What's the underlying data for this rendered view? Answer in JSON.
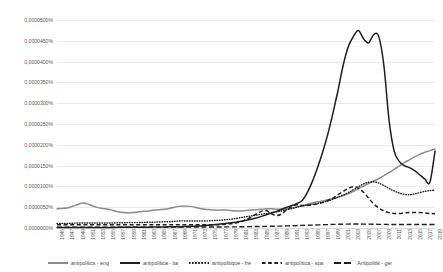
{
  "chart_data": {
    "type": "line",
    "title": "",
    "xlabel": "",
    "ylabel": "",
    "grid": true,
    "legend_position": "bottom",
    "ylim": [
      0,
      5e-05
    ],
    "y_ticks": [
      "0,0000000%",
      "0,0000050%",
      "0,0000100%",
      "0,0000150%",
      "0,0000200%",
      "0,0000250%",
      "0,0000300%",
      "0,0000350%",
      "0,0000400%",
      "0,0000450%",
      "0,0000500%"
    ],
    "y_tick_values": [
      0,
      5e-06,
      1e-05,
      1.5e-05,
      2e-05,
      2.5e-05,
      3e-05,
      3.5e-05,
      4e-05,
      4.5e-05,
      5e-05
    ],
    "x": [
      1945,
      1946,
      1947,
      1948,
      1949,
      1950,
      1951,
      1952,
      1953,
      1954,
      1955,
      1956,
      1957,
      1958,
      1959,
      1960,
      1961,
      1962,
      1963,
      1964,
      1965,
      1966,
      1967,
      1968,
      1969,
      1970,
      1971,
      1972,
      1973,
      1974,
      1975,
      1976,
      1977,
      1978,
      1979,
      1980,
      1981,
      1982,
      1983,
      1984,
      1985,
      1986,
      1987,
      1988,
      1989,
      1990,
      1991,
      1992,
      1993,
      1994,
      1995,
      1996,
      1997,
      1998,
      1999,
      2000,
      2001,
      2002,
      2003,
      2004,
      2005,
      2006,
      2007,
      2008,
      2009,
      2010,
      2011,
      2012,
      2013,
      2014,
      2015,
      2016,
      2017,
      2018,
      2019
    ],
    "x_ticks": [
      "1945",
      "1947",
      "1949",
      "1951",
      "1953",
      "1955",
      "1957",
      "1959",
      "1961",
      "1963",
      "1965",
      "1967",
      "1969",
      "1971",
      "1973",
      "1975",
      "1977",
      "1979",
      "1981",
      "1983",
      "1985",
      "1987",
      "1989",
      "1991",
      "1993",
      "1995",
      "1997",
      "1999",
      "2001",
      "2003",
      "2005",
      "2007",
      "2009",
      "2011",
      "2013",
      "2015",
      "2017",
      "2019"
    ],
    "series": [
      {
        "name": "antipolitics - eng",
        "key": "eng",
        "color": "#8c8c8c",
        "style": "solid",
        "values": [
          4.6e-06,
          4.7e-06,
          4.8e-06,
          5.2e-06,
          5.6e-06,
          6e-06,
          5.8e-06,
          5.3e-06,
          4.9e-06,
          4.7e-06,
          4.5e-06,
          4.2e-06,
          3.9e-06,
          3.7e-06,
          3.6e-06,
          3.7e-06,
          3.9e-06,
          4e-06,
          4.1e-06,
          4.3e-06,
          4.4e-06,
          4.5e-06,
          4.7e-06,
          5e-06,
          5.2e-06,
          5.3e-06,
          5.2e-06,
          5e-06,
          4.7e-06,
          4.5e-06,
          4.4e-06,
          4.3e-06,
          4.3e-06,
          4.3e-06,
          4.2e-06,
          4.1e-06,
          4.1e-06,
          4.2e-06,
          4.3e-06,
          4.4e-06,
          4.5e-06,
          4.6e-06,
          4.6e-06,
          4.5e-06,
          4.5e-06,
          4.6e-06,
          4.8e-06,
          5.1e-06,
          5.4e-06,
          5.7e-06,
          6e-06,
          6.3e-06,
          6.5e-06,
          6.8e-06,
          7.1e-06,
          7.4e-06,
          7.8e-06,
          8.2e-06,
          8.8e-06,
          9.4e-06,
          1.01e-05,
          1.07e-05,
          1.13e-05,
          1.19e-05,
          1.26e-05,
          1.33e-05,
          1.41e-05,
          1.49e-05,
          1.57e-05,
          1.64e-05,
          1.71e-05,
          1.77e-05,
          1.82e-05,
          1.86e-05,
          1.9e-05
        ]
      },
      {
        "name": "antipolitica - ita",
        "key": "ita",
        "color": "#1f1f1f",
        "style": "solid",
        "values": [
          1e-07,
          1e-07,
          1.1e-07,
          1.1e-07,
          1.2e-07,
          1.2e-07,
          1.3e-07,
          1.3e-07,
          1.4e-07,
          1.4e-07,
          1.5e-07,
          1.5e-07,
          1.6e-07,
          1.6e-07,
          1.7e-07,
          1.8e-07,
          1.9e-07,
          2e-07,
          2.1e-07,
          2.2e-07,
          2.4e-07,
          2.6e-07,
          2.8e-07,
          3e-07,
          3.3e-07,
          3.6e-07,
          4e-07,
          4.5e-07,
          5.1e-07,
          6e-07,
          7e-07,
          8.2e-07,
          9.5e-07,
          1.1e-06,
          1.25e-06,
          1.4e-06,
          1.6e-06,
          1.85e-06,
          2.1e-06,
          2.4e-06,
          2.8e-06,
          3.2e-06,
          3.6e-06,
          4e-06,
          4.5e-06,
          5e-06,
          5.4e-06,
          5.9e-06,
          6.6e-06,
          8.5e-06,
          1.12e-05,
          1.45e-05,
          1.82e-05,
          2.25e-05,
          2.75e-05,
          3.3e-05,
          3.9e-05,
          4.35e-05,
          4.6e-05,
          4.75e-05,
          4.55e-05,
          4.45e-05,
          4.65e-05,
          4.6e-05,
          3.9e-05,
          2.6e-05,
          1.85e-05,
          1.6e-05,
          1.5e-05,
          1.45e-05,
          1.38e-05,
          1.28e-05,
          1.18e-05,
          1.1e-05,
          1.85e-05
        ]
      },
      {
        "name": "antipolitique - fre",
        "key": "fre",
        "color": "#1f1f1f",
        "style": "dotted",
        "values": [
          1.1e-06,
          1.1e-06,
          1.1e-06,
          1.15e-06,
          1.2e-06,
          1.2e-06,
          1.2e-06,
          1.2e-06,
          1.2e-06,
          1.2e-06,
          1.2e-06,
          1.2e-06,
          1.25e-06,
          1.25e-06,
          1.3e-06,
          1.3e-06,
          1.3e-06,
          1.35e-06,
          1.4e-06,
          1.4e-06,
          1.45e-06,
          1.5e-06,
          1.5e-06,
          1.6e-06,
          1.7e-06,
          1.7e-06,
          1.7e-06,
          1.7e-06,
          1.7e-06,
          1.7e-06,
          1.75e-06,
          1.8e-06,
          1.9e-06,
          2e-06,
          2.1e-06,
          2.3e-06,
          2.5e-06,
          2.7e-06,
          2.9e-06,
          3.1e-06,
          3.3e-06,
          3.5e-06,
          3.7e-06,
          3.9e-06,
          4.1e-06,
          4.4e-06,
          4.7e-06,
          5e-06,
          5.3e-06,
          5.5e-06,
          5.7e-06,
          5.9e-06,
          6.2e-06,
          6.5e-06,
          6.9e-06,
          7.4e-06,
          7.9e-06,
          8.5e-06,
          9.2e-06,
          9.9e-06,
          1.06e-05,
          1.1e-05,
          1.11e-05,
          1.08e-05,
          1.02e-05,
          9.5e-06,
          8.9e-06,
          8.4e-06,
          8.1e-06,
          8e-06,
          8.2e-06,
          8.5e-06,
          8.8e-06,
          9e-06,
          9.1e-06
        ]
      },
      {
        "name": "antipolítica - spa",
        "key": "spa",
        "color": "#1f1f1f",
        "style": "dashed",
        "values": [
          8e-07,
          8e-07,
          8e-07,
          8e-07,
          8e-07,
          8e-07,
          8e-07,
          8e-07,
          8e-07,
          8e-07,
          8e-07,
          8e-07,
          8e-07,
          8e-07,
          8e-07,
          8e-07,
          8e-07,
          8e-07,
          8e-07,
          8e-07,
          8e-07,
          8e-07,
          8e-07,
          8e-07,
          8e-07,
          8e-07,
          8e-07,
          8e-07,
          8e-07,
          8e-07,
          8e-07,
          8e-07,
          8e-07,
          9e-07,
          1e-06,
          1.2e-06,
          1.5e-06,
          2e-06,
          2.6e-06,
          3.4e-06,
          4e-06,
          4.2e-06,
          3.4e-06,
          3e-06,
          3.4e-06,
          4.4e-06,
          5.2e-06,
          5.6e-06,
          5.4e-06,
          5.4e-06,
          5.6e-06,
          5.8e-06,
          6.1e-06,
          6.6e-06,
          7.2e-06,
          8e-06,
          8.8e-06,
          9.5e-06,
          9.9e-06,
          9.6e-06,
          8.6e-06,
          7.2e-06,
          5.8e-06,
          4.8e-06,
          4.1e-06,
          3.7e-06,
          3.5e-06,
          3.5e-06,
          3.6e-06,
          3.7e-06,
          3.7e-06,
          3.7e-06,
          3.6e-06,
          3.5e-06,
          3.4e-06
        ]
      },
      {
        "name": "Antipolitik - ger",
        "key": "ger",
        "color": "#1f1f1f",
        "style": "longdash",
        "values": [
          2e-07,
          2e-07,
          2e-07,
          2e-07,
          2e-07,
          2e-07,
          2e-07,
          2e-07,
          2e-07,
          2e-07,
          2e-07,
          2e-07,
          2e-07,
          2e-07,
          2e-07,
          2e-07,
          2e-07,
          2e-07,
          2e-07,
          2e-07,
          2e-07,
          2e-07,
          2e-07,
          2.2e-07,
          2.4e-07,
          2.5e-07,
          2.5e-07,
          2.5e-07,
          2.5e-07,
          2.5e-07,
          2.5e-07,
          2.5e-07,
          2.5e-07,
          2.6e-07,
          2.7e-07,
          2.8e-07,
          3e-07,
          3.2e-07,
          3.4e-07,
          3.6e-07,
          3.8e-07,
          4e-07,
          4.2e-07,
          4.4e-07,
          4.6e-07,
          5e-07,
          5.4e-07,
          5.8e-07,
          6.2e-07,
          6.6e-07,
          7e-07,
          7.4e-07,
          7.8e-07,
          8.2e-07,
          8.6e-07,
          9e-07,
          9.2e-07,
          9.4e-07,
          9.6e-07,
          9.6e-07,
          9.4e-07,
          9.2e-07,
          9e-07,
          8.8e-07,
          8.6e-07,
          8.4e-07,
          8.4e-07,
          8.4e-07,
          8.4e-07,
          8.4e-07,
          8.4e-07,
          8.4e-07,
          8.4e-07,
          8.4e-07,
          8.4e-07
        ]
      }
    ]
  },
  "legend": {
    "items": [
      {
        "label": "antipolitics - eng",
        "swatch": "solid-gray"
      },
      {
        "label": "antipolitica - ita",
        "swatch": "solid-black"
      },
      {
        "label": "antipolitique - fre",
        "swatch": "dotted-black"
      },
      {
        "label": "antipolítica - spa",
        "swatch": "dashed-black"
      },
      {
        "label": "Antipolitik - ger",
        "swatch": "longdash-black"
      }
    ]
  }
}
